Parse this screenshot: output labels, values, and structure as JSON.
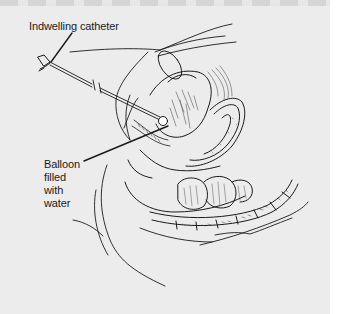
{
  "figure": {
    "type": "medical-illustration",
    "labels": {
      "catheter": "Indwelling catheter",
      "balloon_lines": [
        "Balloon",
        "filled",
        "with",
        "water"
      ]
    },
    "colors": {
      "background": "#ececec",
      "ink": "#1a1a1a",
      "shade": "#555555"
    }
  }
}
